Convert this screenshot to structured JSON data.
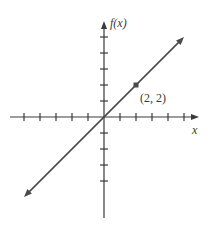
{
  "chart_data": {
    "type": "line",
    "title": "",
    "xlabel": "x",
    "ylabel": "f(x)",
    "xlim": [
      -6,
      6
    ],
    "ylim": [
      -6,
      6
    ],
    "x_ticks": [
      -5,
      -4,
      -3,
      -2,
      -1,
      1,
      2,
      3,
      4,
      5
    ],
    "y_ticks": [
      -4,
      -3,
      -2,
      -1,
      1,
      2,
      3,
      4,
      5
    ],
    "tick_labels_shown": false,
    "grid": false,
    "series": [
      {
        "name": "f(x) = x",
        "x": [
          -5,
          5
        ],
        "y": [
          -5,
          5
        ],
        "arrows": "both"
      }
    ],
    "points": [
      {
        "x": 2,
        "y": 2,
        "label": "(2, 2)"
      }
    ],
    "colors": {
      "line": "#4a4a4a",
      "axis": "#3a3a3a"
    }
  },
  "labels": {
    "y_axis": "f(x)",
    "x_axis": "x",
    "point": "(2, 2)"
  }
}
